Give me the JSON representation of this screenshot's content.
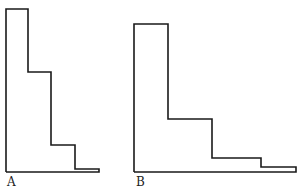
{
  "figures": [
    {
      "label": "A",
      "points": [
        [
          6,
          172
        ],
        [
          6,
          9
        ],
        [
          28,
          9
        ],
        [
          28,
          72
        ],
        [
          51,
          72
        ],
        [
          51,
          145
        ],
        [
          75,
          145
        ],
        [
          75,
          169
        ],
        [
          99,
          169
        ],
        [
          99,
          172
        ],
        [
          6,
          172
        ]
      ],
      "label_pos": [
        7,
        176
      ]
    },
    {
      "label": "B",
      "points": [
        [
          134,
          172
        ],
        [
          134,
          24
        ],
        [
          168,
          24
        ],
        [
          168,
          119
        ],
        [
          212,
          119
        ],
        [
          212,
          158
        ],
        [
          261,
          158
        ],
        [
          261,
          167
        ],
        [
          296,
          167
        ],
        [
          296,
          172
        ],
        [
          134,
          172
        ]
      ],
      "label_pos": [
        136,
        176
      ]
    }
  ],
  "stroke_color": "#1a1a1a"
}
